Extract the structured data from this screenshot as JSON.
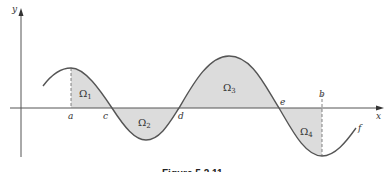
{
  "figure": {
    "caption": "Figure 5.2.11",
    "axes": {
      "x_label": "x",
      "y_label": "y"
    },
    "curve_label": "f",
    "points": [
      {
        "label": "a",
        "x": 71
      },
      {
        "label": "c",
        "x": 112
      },
      {
        "label": "d",
        "x": 179
      },
      {
        "label": "e",
        "x": 279
      },
      {
        "label": "b",
        "x": 322
      }
    ],
    "regions": [
      {
        "symbol": "Ω",
        "sub": "1"
      },
      {
        "symbol": "Ω",
        "sub": "2"
      },
      {
        "symbol": "Ω",
        "sub": "3"
      },
      {
        "symbol": "Ω",
        "sub": "4"
      }
    ],
    "colors": {
      "fill": "#dcdcdc",
      "curve": "#555555",
      "axis": "#555555"
    }
  }
}
